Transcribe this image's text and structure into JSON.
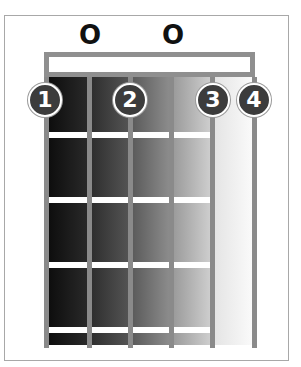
{
  "diagram": {
    "type": "guitar-chord-diagram",
    "open_strings": [
      {
        "label": "O",
        "x": 90
      },
      {
        "label": "O",
        "x": 173
      }
    ],
    "finger_markers": [
      {
        "label": "1",
        "x": 45,
        "y": 100
      },
      {
        "label": "2",
        "x": 130,
        "y": 100
      },
      {
        "label": "3",
        "x": 213,
        "y": 100
      },
      {
        "label": "4",
        "x": 254,
        "y": 100
      }
    ],
    "string_positions_x": [
      46,
      89,
      130,
      171,
      212,
      254
    ],
    "fret_positions_y": [
      135,
      200,
      265,
      330
    ],
    "colors": {
      "frame_border": "#a8a8a8",
      "nut": "#8f8f8f",
      "string": "#8a8a8a",
      "finger_fill": "#3c3c3c",
      "fret": "#ffffff"
    }
  }
}
